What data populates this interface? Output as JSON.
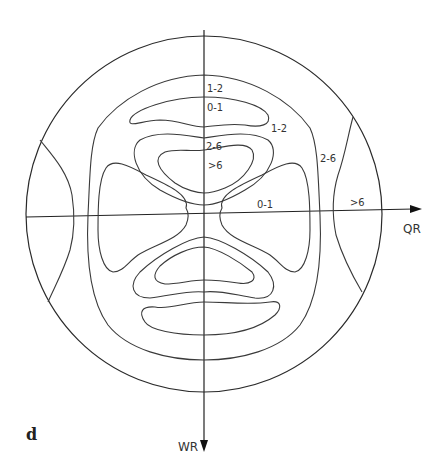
{
  "figure": {
    "panel_label": "d",
    "axes": {
      "horizontal": "QR",
      "vertical": "WR"
    },
    "contour_labels": {
      "top_outer": "1-2",
      "top_inner": "0-1",
      "upper_right": "1-2",
      "center_upper": "2-6",
      "center_peak": ">6",
      "right_band": "2-6",
      "right_mid": "0-1",
      "right_edge": ">6"
    },
    "colors": {
      "line": "#3a3a3a",
      "background": "#ffffff"
    }
  }
}
